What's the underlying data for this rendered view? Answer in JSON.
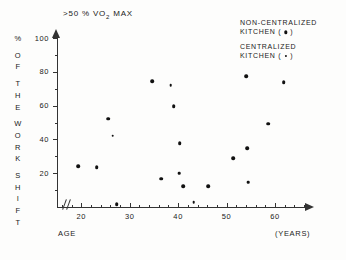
{
  "chart_data": {
    "type": "scatter",
    "title": ">50 % VO2 MAX",
    "title_prefix": ">50 % VO",
    "title_sub": "2",
    "title_suffix": " MAX",
    "xlabel": "AGE",
    "xunits": "(YEARS)",
    "ylabel": "% OF THE WORK SHIFT",
    "ylabel_letters": [
      "%",
      "O",
      "F",
      "T",
      "H",
      "E",
      "W",
      "O",
      "R",
      "K",
      "S",
      "H",
      "I",
      "F",
      "T"
    ],
    "xlim": [
      15,
      67
    ],
    "ylim": [
      0,
      100
    ],
    "xticks": [
      20,
      30,
      40,
      50,
      60
    ],
    "yticks": [
      20,
      40,
      60,
      80,
      100
    ],
    "x_axis_break": true,
    "grid": false,
    "legend_position": "top-right",
    "series": [
      {
        "name": "NON-CENTRALIZED KITCHEN",
        "marker": "filled-circle-large",
        "points": [
          {
            "x": 19.4,
            "y": 24.2
          },
          {
            "x": 23.2,
            "y": 23.6
          },
          {
            "x": 25.6,
            "y": 52.3
          },
          {
            "x": 27.3,
            "y": 1.5
          },
          {
            "x": 34.6,
            "y": 74.4
          },
          {
            "x": 36.5,
            "y": 16.8
          },
          {
            "x": 39.1,
            "y": 59.6
          },
          {
            "x": 40.3,
            "y": 37.9
          },
          {
            "x": 41.0,
            "y": 12.2
          },
          {
            "x": 46.2,
            "y": 12.4
          },
          {
            "x": 51.3,
            "y": 29.0
          },
          {
            "x": 54.0,
            "y": 77.4
          },
          {
            "x": 54.3,
            "y": 34.8
          },
          {
            "x": 58.6,
            "y": 49.3
          },
          {
            "x": 61.8,
            "y": 73.7
          }
        ]
      },
      {
        "name": "CENTRALIZED KITCHEN",
        "marker": "filled-circle-small",
        "points": [
          {
            "x": 26.5,
            "y": 42.2
          },
          {
            "x": 38.5,
            "y": 72.0
          },
          {
            "x": 40.2,
            "y": 19.9
          },
          {
            "x": 43.2,
            "y": 3.0
          },
          {
            "x": 54.4,
            "y": 14.5
          }
        ]
      }
    ]
  },
  "legend": {
    "entries": [
      {
        "line1": "NON-CENTRALIZED",
        "line2_prefix": "KITCHEN (",
        "line2_suffix": ")",
        "marker": "filled-circle-large"
      },
      {
        "line1": "CENTRALIZED",
        "line2_prefix": "KITCHEN (",
        "line2_suffix": ")",
        "marker": "filled-circle-small"
      }
    ]
  },
  "axis": {
    "y_tick_labels": [
      "100",
      "80",
      "60",
      "40",
      "20"
    ],
    "x_tick_labels": [
      "20",
      "30",
      "40",
      "50",
      "60"
    ]
  },
  "colors": {
    "ink": "#222222",
    "marker": "#111111",
    "background": "#fdfdfc"
  }
}
